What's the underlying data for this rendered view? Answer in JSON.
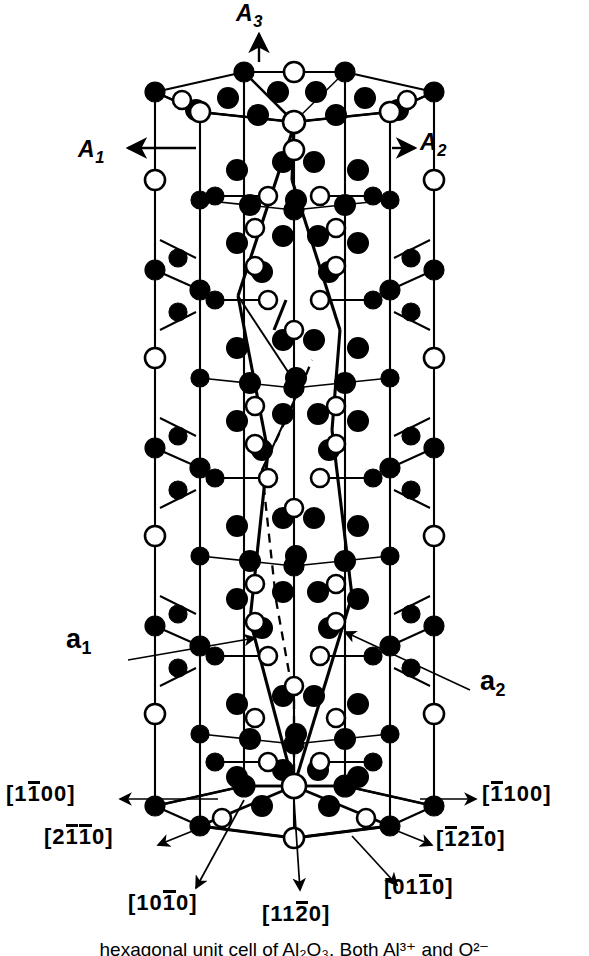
{
  "figure": {
    "kind": "crystal-structure-diagram",
    "background_color": "#ffffff",
    "line_color": "#000000",
    "filled_atom_color": "#000000",
    "open_atom_fill": "#ffffff"
  },
  "axes": {
    "a3": {
      "label": "A",
      "sub": "3",
      "arrow": "up"
    },
    "a1": {
      "label": "A",
      "sub": "1",
      "arrow": "left"
    },
    "a2": {
      "label": "A",
      "sub": "2",
      "arrow": "right"
    }
  },
  "vectors": {
    "a1": {
      "label": "a",
      "sub": "1"
    },
    "a2": {
      "label": "a",
      "sub": "2"
    }
  },
  "miller_directions": {
    "left_top": {
      "open": "[",
      "d1": "1",
      "d2": "1",
      "d2_bar": true,
      "d3": "0",
      "d4": "0",
      "close": "]"
    },
    "right_top": {
      "open": "[",
      "d1": "1",
      "d1_bar": true,
      "d2": "1",
      "d3": "0",
      "d4": "0",
      "close": "]"
    },
    "left_mid": {
      "open": "[",
      "d1": "2",
      "d2": "1",
      "d2_bar": true,
      "d3": "1",
      "d3_bar": true,
      "d4": "0",
      "close": "]"
    },
    "right_mid": {
      "open": "[",
      "d1": "1",
      "d1_bar": true,
      "d2": "2",
      "d3": "1",
      "d3_bar": true,
      "d4": "0",
      "close": "]"
    },
    "bottom_left": {
      "open": "[",
      "d1": "1",
      "d2": "0",
      "d3": "1",
      "d3_bar": true,
      "d4": "0",
      "close": "]"
    },
    "bottom_mid": {
      "open": "[",
      "d1": "1",
      "d2": "1",
      "d3": "2",
      "d3_bar": true,
      "d4": "0",
      "close": "]"
    },
    "bottom_right": {
      "open": "[",
      "d1": "0",
      "d2": "1",
      "d3": "1",
      "d3_bar": true,
      "d4": "0",
      "close": "]"
    }
  },
  "caption": {
    "text": "hexagonal unit cell of Al₂O₃. Both Al³⁺ and O²⁻"
  }
}
